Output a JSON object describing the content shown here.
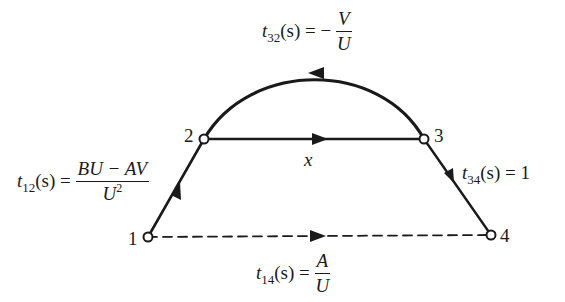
{
  "diagram": {
    "type": "signal-flow-graph",
    "nodes": [
      {
        "id": "1",
        "label": "1",
        "x": 148,
        "y": 237
      },
      {
        "id": "2",
        "label": "2",
        "x": 204,
        "y": 139
      },
      {
        "id": "3",
        "label": "3",
        "x": 424,
        "y": 139
      },
      {
        "id": "4",
        "label": "4",
        "x": 491,
        "y": 235
      }
    ],
    "edges": [
      {
        "from": "1",
        "to": "2",
        "style": "solid",
        "label_func": "t",
        "label_sub": "12",
        "label_arg": "(s) =",
        "label_num": "BU − AV",
        "label_den": "U",
        "label_den_sup": "2"
      },
      {
        "from": "2",
        "to": "3",
        "style": "solid",
        "label": "x"
      },
      {
        "from": "3",
        "to": "2",
        "style": "solid-curved",
        "label_func": "t",
        "label_sub": "32",
        "label_arg": "(s) = −",
        "label_num": "V",
        "label_den": "U"
      },
      {
        "from": "3",
        "to": "4",
        "style": "solid",
        "label_func": "t",
        "label_sub": "34",
        "label_arg": "(s) = 1"
      },
      {
        "from": "1",
        "to": "4",
        "style": "dashed",
        "label_func": "t",
        "label_sub": "14",
        "label_arg": "(s) =",
        "label_num": "A",
        "label_den": "U"
      }
    ],
    "colors": {
      "ink": "#1a1a1a",
      "background": "#ffffff"
    }
  }
}
